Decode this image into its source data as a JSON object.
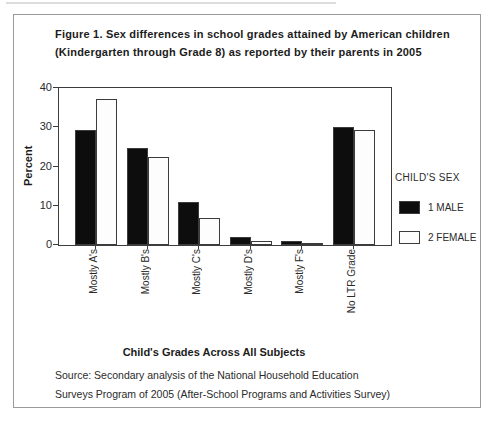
{
  "figure": {
    "title_line1": "Figure 1. Sex differences in school grades attained by American children",
    "title_line2": "(Kindergarten through Grade 8) as reported by their parents in 2005",
    "source_line1": "Source: Secondary analysis of the National Household Education",
    "source_line2": "Surveys Program of 2005 (After-School Programs and Activities Survey)"
  },
  "chart_data": {
    "type": "bar",
    "title": "Figure 1. Sex differences in school grades attained by American children (Kindergarten through Grade 8) as reported by their parents in 2005",
    "categories": [
      "Mostly A's",
      "Mostly B's",
      "Mostly C's",
      "Mostly D's",
      "Mostly F's",
      "No LTR Grade"
    ],
    "series": [
      {
        "name": "1 MALE",
        "color": "#0d0d0d",
        "values": [
          29.4,
          24.6,
          11.0,
          2.0,
          1.0,
          30.0
        ]
      },
      {
        "name": "2 FEMALE",
        "color": "#fdfdfd",
        "values": [
          37.2,
          22.4,
          6.8,
          1.0,
          0.4,
          29.4
        ]
      }
    ],
    "xlabel": "Child's Grades Across All Subjects",
    "ylabel": "Percent",
    "ylim": [
      0,
      40
    ],
    "yticks": [
      0,
      10,
      20,
      30,
      40
    ],
    "legend_title": "CHILD'S SEX",
    "legend_position": "right",
    "grid": false,
    "bar_edge_color": "#3c3c3c"
  }
}
